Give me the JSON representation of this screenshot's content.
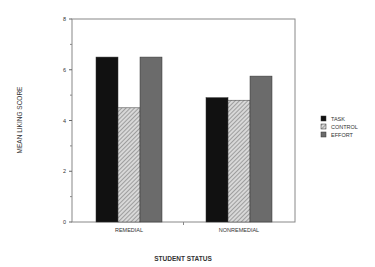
{
  "chart_data": {
    "type": "bar",
    "title": "",
    "xlabel": "STUDENT STATUS",
    "ylabel": "MEAN LIKING SCORE",
    "ylim": [
      0,
      8
    ],
    "yticks": [
      0,
      2,
      4,
      6,
      8
    ],
    "categories": [
      "REMEDIAL",
      "NONREMEDIAL"
    ],
    "series": [
      {
        "name": "TASK",
        "values": [
          6.5,
          4.9
        ],
        "fill": "#111111"
      },
      {
        "name": "CONTROL",
        "values": [
          4.5,
          4.8
        ],
        "fill": "hatch"
      },
      {
        "name": "EFFORT",
        "values": [
          6.5,
          5.75
        ],
        "fill": "#6b6b6b"
      }
    ],
    "legend_position": "right",
    "grid": false
  }
}
